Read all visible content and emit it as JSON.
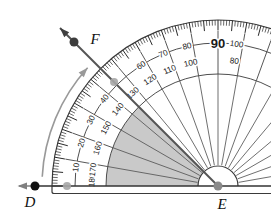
{
  "diagram": {
    "type": "protractor-angle-measure",
    "background": "#ffffff",
    "points": {
      "D": {
        "label": "D",
        "style": "filled-black-dot",
        "on": "baseline-ray"
      },
      "E": {
        "label": "E",
        "style": "gray-dot",
        "on": "vertex-protractor-center"
      },
      "F": {
        "label": "F",
        "style": "dark-gray-dot",
        "on": "upper-ray"
      }
    },
    "rays": {
      "ED_deg": 180,
      "EF_deg": 135
    },
    "shaded_sector": {
      "from_deg": 135,
      "to_deg": 180
    },
    "curved_arrow": {
      "from": "D",
      "toward": "F"
    },
    "protractor": {
      "tick_step_deg": 1,
      "medium_tick_step_deg": 5,
      "label_step_deg": 10,
      "outer_scale_labels": [
        10,
        20,
        30,
        40,
        50,
        60,
        70,
        80,
        100
      ],
      "outer_scale_occluded_labels": [
        50
      ],
      "inner_scale_labels": [
        180,
        170,
        160,
        150,
        140,
        130,
        120,
        110,
        100,
        80
      ],
      "shared_90_label": "90"
    },
    "marker_dots": {
      "count": 2,
      "positions": [
        "baseline-at-outer-0",
        "on-ray-EF-at-scale-band"
      ]
    },
    "colors": {
      "outline": "#3a3a3a",
      "ticks": "#2a2a2a",
      "numbers": "#1a1a1a",
      "sector": "#c9c9c9",
      "radial_lines": "#555555",
      "baseline": "#333333",
      "ray_EF": "#555555",
      "ray_D_arrow": "#808080",
      "curved_arrow": "#999999",
      "marker_dot": "#a6a6a6",
      "point_D": "#111111",
      "point_E": "#8a8a8a",
      "point_F": "#3d3d3d"
    }
  }
}
